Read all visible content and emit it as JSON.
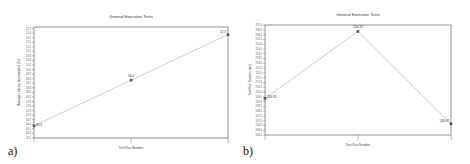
{
  "chart_data": [
    {
      "type": "line",
      "panel_label": "a)",
      "title": "General Execution Tests",
      "xlabel": "Test Run Number",
      "ylabel": "Average Latency Improvement (%)",
      "x": [
        1,
        2,
        3
      ],
      "categories": [
        "1",
        "2",
        "3"
      ],
      "values": [
        46.3,
        49.3,
        52.3
      ],
      "data_labels": [
        "46.3",
        "49.3",
        "52.3"
      ],
      "ylim": [
        45.5,
        52.8
      ],
      "yticks_step": 0.3,
      "grid": false,
      "legend": null,
      "line_color": "#c8c8c8",
      "marker_color": "#555555"
    },
    {
      "type": "line",
      "panel_label": "b)",
      "title": "General Execution Tests",
      "xlabel": "Test Run Number",
      "ylabel": "Total Run Duration (ms)",
      "x": [
        1,
        2,
        3
      ],
      "categories": [
        "1",
        "2",
        "3"
      ],
      "values": [
        249.33,
        256.33,
        246.67
      ],
      "data_labels": [
        "249.33",
        "256.33",
        "246.67"
      ],
      "ylim": [
        245.5,
        257.0
      ],
      "yticks_step": 0.5,
      "grid": false,
      "legend": null,
      "line_color": "#c8c8c8",
      "marker_color": "#555555"
    }
  ]
}
